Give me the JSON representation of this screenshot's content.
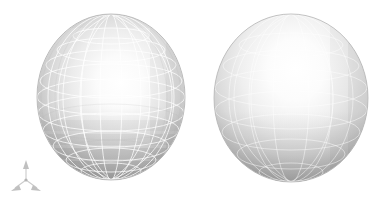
{
  "canvas": {
    "width": 386,
    "height": 207,
    "background_color": "#ffffff",
    "title": "",
    "caption": ""
  },
  "chart_data": {
    "type": "scatter",
    "title": "",
    "subtitle": "",
    "xlabel": "",
    "ylabel": "",
    "grid": false,
    "legend_position": "none",
    "render_style": "shaded 3D surface mesh",
    "projection": "perspective",
    "light_direction": "upper-left",
    "objects": [
      {
        "name": "coarse-mesh-sphere",
        "label": "Left sphere",
        "shape": "sphere",
        "center_x": 111,
        "center_y": 97,
        "radius_x": 74,
        "radius_y": 83,
        "bounds": {
          "left": 37,
          "top": 14,
          "right": 185,
          "bottom": 180
        },
        "mesh": {
          "visible": true,
          "style": "faceted",
          "meridians": 16,
          "parallels": 12,
          "line_color": "#ffffff",
          "line_opacity": 0.85,
          "line_width": 0.9,
          "facet_shading": true
        },
        "surface": {
          "base_color": "#d2d2d2",
          "highlight_color": "#ffffff",
          "shadow_color": "#9a9a9a",
          "edge_color": "#8f8f8f",
          "highlight_x": 120,
          "highlight_y": 82
        }
      },
      {
        "name": "fine-mesh-sphere",
        "label": "Right sphere",
        "shape": "sphere",
        "center_x": 291,
        "center_y": 98,
        "radius_x": 77,
        "radius_y": 84,
        "bounds": {
          "left": 214,
          "top": 14,
          "right": 369,
          "bottom": 182
        },
        "mesh": {
          "visible": true,
          "style": "smooth",
          "meridians": 10,
          "parallels": 8,
          "line_color": "#ffffff",
          "line_opacity": 0.6,
          "line_width": 0.8,
          "facet_shading": false
        },
        "surface": {
          "base_color": "#d8d8d8",
          "highlight_color": "#ffffff",
          "shadow_color": "#9e9e9e",
          "edge_color": "#8a8a8a",
          "highlight_x": 256,
          "highlight_y": 72
        }
      }
    ],
    "axis_triad": {
      "name": "coordinate-axis-triad",
      "visible": true,
      "origin_x": 26,
      "origin_y": 180,
      "line_color": "#c8c8c8",
      "arrow_color": "#bdbdbd",
      "axes": [
        {
          "name": "z-axis",
          "label": "",
          "tip_x": 26,
          "tip_y": 163
        },
        {
          "name": "x-axis",
          "label": "",
          "tip_x": 13.5,
          "tip_y": 190
        },
        {
          "name": "y-axis",
          "label": "",
          "tip_x": 39,
          "tip_y": 189
        }
      ]
    }
  }
}
